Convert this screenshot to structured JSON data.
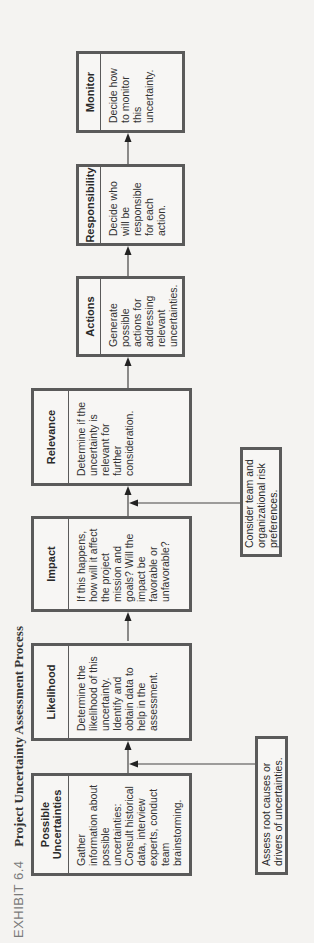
{
  "title": {
    "exhibit_label": "EXHIBIT 6.4",
    "caption": "Project Uncertainty Assessment Process"
  },
  "steps": [
    {
      "heading": "Possible Uncertainties",
      "description": "Gather information about possible uncertainties: Consult historical data, interview experts, conduct team brainstorming."
    },
    {
      "heading": "Likelihood",
      "description": "Determine the likelihood of this uncertainty. Identify and obtain data to help in the assessment."
    },
    {
      "heading": "Impact",
      "description": "If this happens, how will it affect the project mission and goals? Will the impact be favorable or unfavorable?"
    },
    {
      "heading": "Relevance",
      "description": "Determine if the uncertainty is relevant for further consideration."
    },
    {
      "heading": "Actions",
      "description": "Generate possible actions for addressing relevant uncertainties."
    },
    {
      "heading": "Responsibility",
      "description": "Decide who will be responsible for each action."
    },
    {
      "heading": "Monitor",
      "description": "Decide how to monitor this uncertainty."
    }
  ],
  "inputs": [
    {
      "text": "Assess root causes or drivers of uncertainties.",
      "feeds_into": "Likelihood"
    },
    {
      "text": "Consider team and organizational risk preferences.",
      "feeds_into": "Relevance"
    }
  ]
}
